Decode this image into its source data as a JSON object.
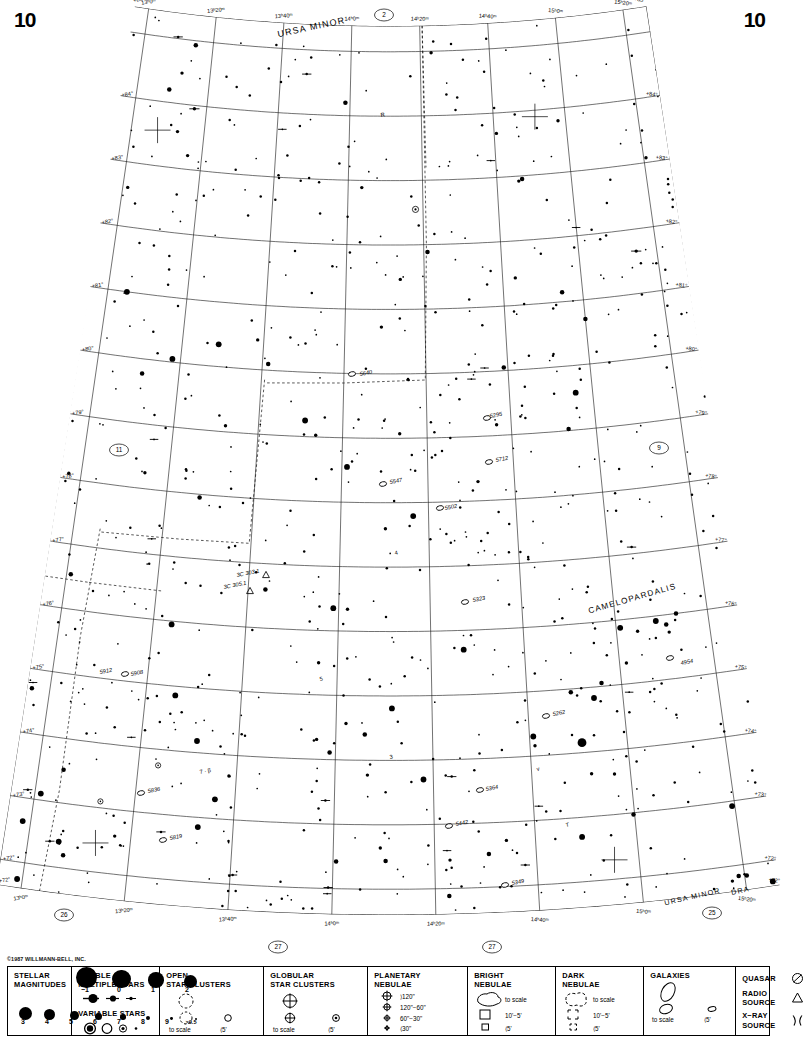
{
  "page": {
    "number_left": "10",
    "number_right": "10"
  },
  "copyright": "©1987 WILLMANN-BELL, INC.",
  "chart": {
    "constellations": [
      {
        "name": "URSA MINOR",
        "x": 312,
        "y": 30,
        "rot": -12,
        "size": 9
      },
      {
        "name": "CAMELOPARDALIS",
        "x": 633,
        "y": 601,
        "rot": -16,
        "size": 8.2
      },
      {
        "name": "URSA MINOR",
        "x": 693,
        "y": 899,
        "rot": -13,
        "size": 7.2
      },
      {
        "name": "DRA",
        "x": 741,
        "y": 893,
        "rot": -13,
        "size": 7.2
      }
    ],
    "ra_labels_top": [
      "15ʰ20ᵐ",
      "15ʰ0ᵐ",
      "14ʰ40ᵐ",
      "14ʰ20ᵐ",
      "14ʰ0ᵐ",
      "13ʰ40ᵐ",
      "13ʰ20ᵐ",
      "13ʰ0ᵐ"
    ],
    "ra_labels_bottom": [
      "15ʰ20ᵐ",
      "15ʰ0ᵐ",
      "14ʰ40ᵐ",
      "14ʰ20ᵐ",
      "14ʰ0ᵐ",
      "13ʰ40ᵐ",
      "13ʰ20ᵐ",
      "13ʰ0ᵐ"
    ],
    "dec_labels_corner": [
      "+85°",
      "+85°"
    ],
    "dec_labels_left": [
      "+84°",
      "+83°",
      "+82°",
      "+81°",
      "+80°",
      "+79°",
      "+78°",
      "+77°",
      "+76°",
      "+75°",
      "+74°",
      "+73°",
      "+72°"
    ],
    "dec_labels_right": [
      "+84°",
      "+83°",
      "+82°",
      "+81°",
      "+80°",
      "+79°",
      "+78°",
      "+77°",
      "+76°",
      "+75°",
      "+74°",
      "+73°",
      "+72°"
    ],
    "adjacent_charts": [
      {
        "label": "2",
        "x": 384,
        "y": 15
      },
      {
        "label": "11",
        "x": 119,
        "y": 450
      },
      {
        "label": "9",
        "x": 659,
        "y": 448
      },
      {
        "label": "26",
        "x": 64,
        "y": 915
      },
      {
        "label": "27",
        "x": 278,
        "y": 947
      },
      {
        "label": "27",
        "x": 492,
        "y": 947
      },
      {
        "label": "25",
        "x": 712,
        "y": 913
      }
    ],
    "object_labels": [
      {
        "text": "R",
        "x": 381,
        "y": 117,
        "type": "variable"
      },
      {
        "text": "5640",
        "x": 360,
        "y": 376,
        "type": "galaxy"
      },
      {
        "text": "5295",
        "x": 490,
        "y": 418,
        "type": "galaxy"
      },
      {
        "text": "5712",
        "x": 496,
        "y": 462,
        "type": "galaxy"
      },
      {
        "text": "5547",
        "x": 390,
        "y": 484,
        "type": "galaxy"
      },
      {
        "text": "5502",
        "x": 445,
        "y": 510,
        "type": "galaxy"
      },
      {
        "text": "4",
        "x": 395,
        "y": 555,
        "type": "star"
      },
      {
        "text": "3C 303.1",
        "x": 237,
        "y": 577,
        "type": "radio"
      },
      {
        "text": "3C 305.1",
        "x": 224,
        "y": 589,
        "type": "radio"
      },
      {
        "text": "5323",
        "x": 473,
        "y": 602,
        "type": "galaxy"
      },
      {
        "text": "5912",
        "x": 100,
        "y": 674,
        "type": "galaxy"
      },
      {
        "text": "5908",
        "x": 131,
        "y": 676,
        "type": "galaxy"
      },
      {
        "text": "5",
        "x": 320,
        "y": 681,
        "type": "star"
      },
      {
        "text": "4954",
        "x": 681,
        "y": 665,
        "type": "galaxy"
      },
      {
        "text": "5262",
        "x": 553,
        "y": 716,
        "type": "galaxy"
      },
      {
        "text": "3",
        "x": 390,
        "y": 759,
        "type": "star"
      },
      {
        "text": "v",
        "x": 537,
        "y": 771,
        "type": "variable"
      },
      {
        "text": "7 · β",
        "x": 200,
        "y": 774,
        "type": "star"
      },
      {
        "text": "5836",
        "x": 148,
        "y": 793,
        "type": "galaxy"
      },
      {
        "text": "5364",
        "x": 486,
        "y": 791,
        "type": "galaxy"
      },
      {
        "text": "5442",
        "x": 456,
        "y": 826,
        "type": "galaxy"
      },
      {
        "text": "T",
        "x": 566,
        "y": 827,
        "type": "variable"
      },
      {
        "text": "5819",
        "x": 170,
        "y": 840,
        "type": "galaxy"
      },
      {
        "text": "5349",
        "x": 512,
        "y": 885,
        "type": "galaxy"
      }
    ]
  },
  "legend": {
    "stellar_magnitudes": {
      "title": "STELLAR\nMAGNITUDES",
      "bright_labels": [
        "−1",
        "0",
        "1",
        "2"
      ],
      "bright_radii": [
        10.5,
        9.2,
        7.8,
        6.6
      ],
      "faint_labels": [
        "3",
        "4",
        "5",
        "6",
        "7",
        "8",
        "9",
        ">9.5"
      ],
      "faint_radii": [
        6.6,
        5.6,
        4.5,
        3.6,
        2.8,
        2.0,
        1.4,
        1.0
      ]
    },
    "double_stars": {
      "title": "DOUBLE  OR\nMULTIPLE STARS"
    },
    "variable_stars": {
      "title": "VARIABLE  STARS"
    },
    "open_clusters": {
      "title": "OPEN\nSTAR CLUSTERS",
      "to_scale": "to scale",
      "small": "⟨5'"
    },
    "globular_clusters": {
      "title": "GLOBULAR\nSTAR CLUSTERS",
      "to_scale": "to scale",
      "small": "⟨5'"
    },
    "planetary_nebulae": {
      "title": "PLANETARY\nNEBULAE",
      "sizes": [
        "⟩120\"",
        "120\"−60\"",
        "60\"−30\"",
        "⟨30\""
      ]
    },
    "bright_nebulae": {
      "title": "BRIGHT\nNEBULAE",
      "to_scale": "to scale",
      "mid": "10'−5'",
      "small": "⟨5'"
    },
    "dark_nebulae": {
      "title": "DARK\nNEBULAE",
      "to_scale": "to scale",
      "mid": "10'−5'",
      "small": "⟨5'"
    },
    "galaxies": {
      "title": "GALAXIES",
      "to_scale": "to scale",
      "small": "⟨5'"
    },
    "quasar": {
      "title": "QUASAR"
    },
    "radio_source": {
      "title": "RADIO\nSOURCE"
    },
    "xray_source": {
      "title": "X−RAY\nSOURCE"
    }
  },
  "colors": {
    "ink": "#000000",
    "paper": "#ffffff",
    "grid": "#333333"
  }
}
